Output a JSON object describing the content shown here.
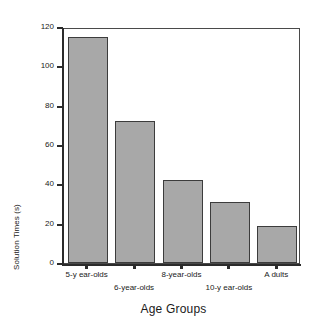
{
  "chart_data": {
    "type": "bar",
    "title": "",
    "xlabel": "Age Groups",
    "ylabel": "Solution Times (s)",
    "categories": [
      "5-y ear-olds",
      "6-year-olds",
      "8-year-olds",
      "10-y ear-olds",
      "A dults"
    ],
    "values": [
      115,
      72,
      42,
      31,
      19
    ],
    "ylim": [
      0,
      120
    ],
    "yticks": [
      0,
      20,
      40,
      60,
      80,
      100,
      120
    ],
    "ytick_labels": [
      "0",
      "20",
      "40",
      "60",
      "80",
      "100",
      "120"
    ],
    "grid": false,
    "legend": null,
    "bar_color": "#a8a8a8",
    "bar_edge_color": "#3c3c3c",
    "axis_color": "#2b2b2b",
    "background": "#ffffff",
    "xtick_label_rows": [
      0,
      1,
      0,
      1,
      0
    ]
  }
}
